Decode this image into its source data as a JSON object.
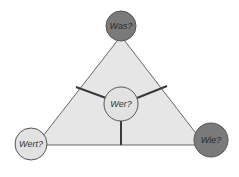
{
  "diagram": {
    "type": "triangle-model",
    "colors": {
      "triangle_fill": "#e6e6e6",
      "triangle_stroke": "#555555",
      "spoke": "#3a3a3a",
      "dark_node": "#7a7a7a",
      "light_node": "#e2e2e2",
      "node_stroke": "#555555",
      "text": "#333333"
    },
    "nodes": {
      "top": {
        "label": "Was?"
      },
      "left": {
        "label": "Wert?"
      },
      "right": {
        "label": "Wie?"
      },
      "center": {
        "label": "Wer?"
      }
    }
  }
}
